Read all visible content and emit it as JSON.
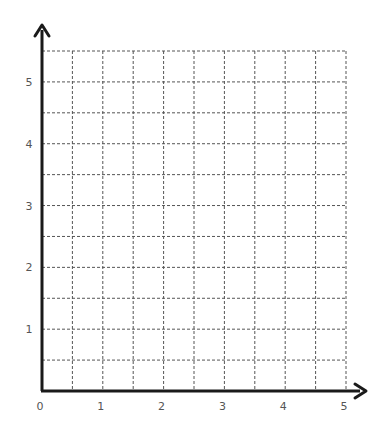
{
  "chart_data": {
    "type": "grid",
    "title": "",
    "xlabel": "",
    "ylabel": "",
    "x_ticks": [
      "0",
      "1",
      "2",
      "3",
      "4",
      "5"
    ],
    "y_ticks": [
      "1",
      "2",
      "3",
      "4",
      "5"
    ],
    "xlim": [
      0,
      5
    ],
    "ylim": [
      0,
      5.5
    ],
    "grid": {
      "on": true,
      "style": "dashed",
      "x_step": 0.5,
      "y_step": 0.5,
      "columns": 10,
      "rows": 11
    },
    "axes": {
      "arrows": true,
      "color": "#1a1a1a"
    },
    "series": []
  },
  "colors": {
    "axis": "#1a1a1a",
    "grid": "#555555",
    "label": "#555555",
    "background": "#ffffff"
  }
}
